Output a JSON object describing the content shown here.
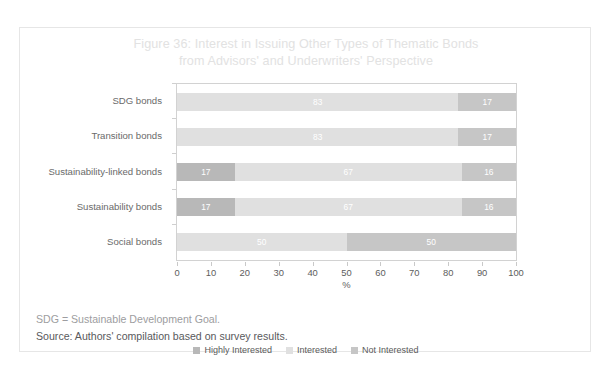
{
  "figure": {
    "title_line1": "Figure 36: Interest in Issuing Other Types of Thematic Bonds",
    "title_line2": "from Advisors' and Underwriters' Perspective",
    "title_color": "#e2e2e2"
  },
  "notes": {
    "abbreviation": "SDG = Sustainable Development Goal.",
    "source": "Source: Authors' compilation based on survey results."
  },
  "chart_data": {
    "type": "bar",
    "orientation": "horizontal",
    "stacked": true,
    "title": "Figure 36: Interest in Issuing Other Types of Thematic Bonds from Advisors' and Underwriters' Perspective",
    "xlabel": "%",
    "ylabel": "",
    "xlim": [
      0,
      100
    ],
    "xticks": [
      0,
      10,
      20,
      30,
      40,
      50,
      60,
      70,
      80,
      90,
      100
    ],
    "xtick_labels": [
      "0",
      "10",
      "20",
      "30",
      "40",
      "50",
      "60",
      "70",
      "80",
      "90",
      "100"
    ],
    "grid": false,
    "legend_position": "bottom-center",
    "categories": [
      "SDG bonds",
      "Transition bonds",
      "Sustainability-linked bonds",
      "Sustainability bonds",
      "Social bonds"
    ],
    "series": [
      {
        "name": "Highly Interested",
        "color": "#b8b8b8",
        "values": [
          0,
          0,
          17,
          17,
          0
        ],
        "labels": [
          "",
          "",
          "17",
          "17",
          ""
        ]
      },
      {
        "name": "Interested",
        "color": "#e0e0e0",
        "values": [
          83,
          83,
          67,
          67,
          50
        ],
        "labels": [
          "83",
          "83",
          "67",
          "67",
          "50"
        ]
      },
      {
        "name": "Not Interested",
        "color": "#c6c6c6",
        "values": [
          17,
          17,
          16,
          16,
          50
        ],
        "labels": [
          "17",
          "17",
          "16",
          "16",
          "50"
        ]
      }
    ]
  }
}
